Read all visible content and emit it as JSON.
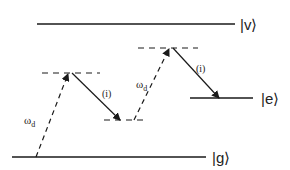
{
  "diagram": {
    "type": "energy-level-diagram",
    "colors": {
      "line": "#1a1a1a",
      "text": "#222222",
      "background": "#ffffff"
    },
    "levels": [
      {
        "id": "v",
        "label": "v",
        "ket": "|v⟩",
        "x1": 37,
        "x2": 235,
        "y": 24,
        "style": "solid",
        "label_x": 241
      },
      {
        "id": "e",
        "label": "e",
        "ket": "|e⟩",
        "x1": 190,
        "x2": 253,
        "y": 98,
        "style": "solid",
        "label_x": 261
      },
      {
        "id": "g",
        "label": "g",
        "ket": "|g⟩",
        "x1": 12,
        "x2": 206,
        "y": 157,
        "style": "solid",
        "label_x": 213
      }
    ],
    "virtual_levels": [
      {
        "id": "virtual-left-upper",
        "x1": 42,
        "x2": 100,
        "y": 73,
        "style": "dashed"
      },
      {
        "id": "virtual-left-lower",
        "x1": 104,
        "x2": 148,
        "y": 120,
        "style": "dashed"
      },
      {
        "id": "virtual-right-upper",
        "x1": 138,
        "x2": 198,
        "y": 48,
        "style": "dashed"
      }
    ],
    "transitions": [
      {
        "id": "drive-1",
        "label": "ω",
        "subscript": "d",
        "from": [
          36,
          157
        ],
        "to": [
          68,
          73
        ],
        "style": "dashed",
        "label_pos": [
          24,
          122
        ]
      },
      {
        "id": "interaction-1",
        "label": "(i)",
        "from": [
          72,
          73
        ],
        "to": [
          120,
          120
        ],
        "style": "solid",
        "label_pos": [
          103,
          95
        ]
      },
      {
        "id": "drive-2",
        "label": "ω",
        "subscript": "d",
        "from": [
          134,
          120
        ],
        "to": [
          169,
          48
        ],
        "style": "dashed",
        "label_pos": [
          136,
          86
        ]
      },
      {
        "id": "interaction-2",
        "label": "(i)",
        "from": [
          173,
          48
        ],
        "to": [
          219,
          98
        ],
        "style": "solid",
        "label_pos": [
          197,
          70
        ]
      }
    ]
  }
}
